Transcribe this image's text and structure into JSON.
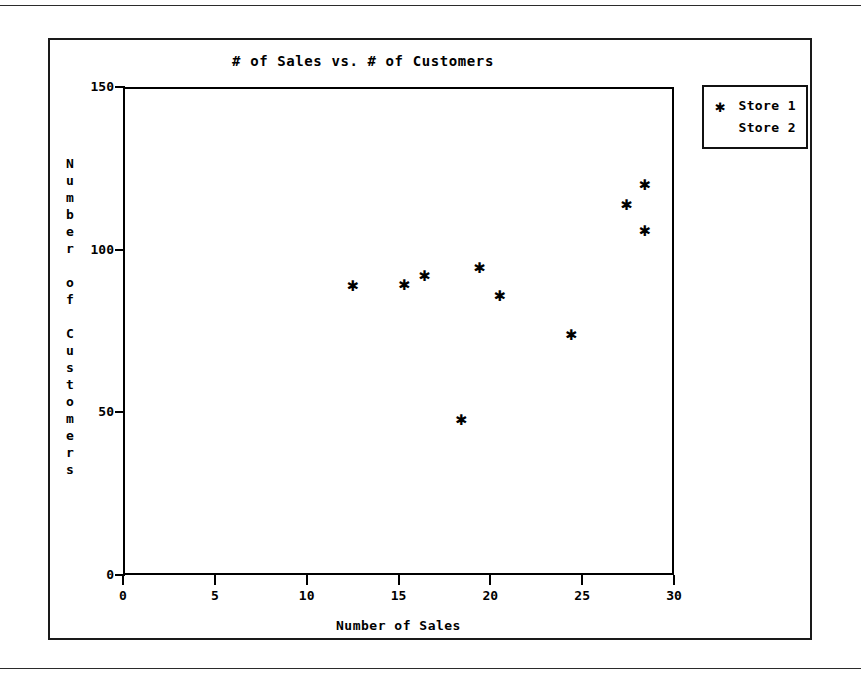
{
  "chart_data": {
    "type": "scatter",
    "title": "# of Sales vs. # of Customers",
    "xlabel": "Number of Sales",
    "ylabel": "Number of Customers",
    "xlim": [
      0,
      30
    ],
    "ylim": [
      0,
      150
    ],
    "xticks": [
      0,
      5,
      10,
      15,
      20,
      25,
      30
    ],
    "yticks": [
      0,
      50,
      100,
      150
    ],
    "grid": false,
    "legend_position": "outside-top-right",
    "series": [
      {
        "name": "Store 1",
        "marker": "*",
        "marker_glyph": "✱",
        "color": "#000000",
        "points": [
          {
            "x": 12.4,
            "y": 90
          },
          {
            "x": 15.2,
            "y": 90.5
          },
          {
            "x": 16.3,
            "y": 93
          },
          {
            "x": 18.3,
            "y": 49
          },
          {
            "x": 19.3,
            "y": 95.5
          },
          {
            "x": 20.4,
            "y": 87
          },
          {
            "x": 24.3,
            "y": 75
          },
          {
            "x": 27.3,
            "y": 115
          },
          {
            "x": 28.3,
            "y": 121
          },
          {
            "x": 28.3,
            "y": 107
          }
        ]
      },
      {
        "name": "Store 2",
        "marker": "",
        "marker_glyph": "",
        "color": "#000000",
        "points": []
      }
    ]
  },
  "chart": {
    "title": "# of Sales vs. # of Customers",
    "x_axis": {
      "title": "Number of Sales",
      "tick_labels": [
        "0",
        "5",
        "10",
        "15",
        "20",
        "25",
        "30"
      ]
    },
    "y_axis": {
      "title": "Number of Customers",
      "title_chars": [
        "N",
        "u",
        "m",
        "b",
        "e",
        "r",
        "",
        "o",
        "f",
        "",
        "C",
        "u",
        "s",
        "t",
        "o",
        "m",
        "e",
        "r",
        "s"
      ],
      "tick_labels": [
        "0",
        "50",
        "100",
        "150"
      ]
    },
    "legend": {
      "entries": [
        {
          "marker": "✱",
          "label": "Store 1"
        },
        {
          "marker": "",
          "label": "Store 2"
        }
      ]
    }
  }
}
